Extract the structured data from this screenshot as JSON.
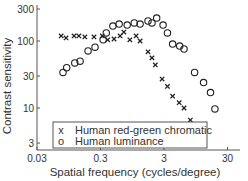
{
  "chart_data": {
    "type": "scatter",
    "title": "",
    "xlabel": "Spatial frequency (cycles/degree)",
    "ylabel": "Contrast sensitivity",
    "xscale": "log",
    "yscale": "log",
    "xlim": [
      0.03,
      40
    ],
    "ylim": [
      2,
      300
    ],
    "xticks": [
      0.03,
      0.3,
      3,
      30
    ],
    "xtick_labels": [
      "0.03",
      "0.3",
      "3",
      "30"
    ],
    "yticks": [
      3,
      10,
      30,
      100,
      300
    ],
    "ytick_labels": [
      "3",
      "10",
      "30",
      "100",
      "300"
    ],
    "grid": false,
    "legend_position": "lower center (inside)",
    "series": [
      {
        "name": "Human red-green chromatic",
        "marker": "x",
        "legend_marker": "x",
        "x": [
          0.072,
          0.086,
          0.115,
          0.137,
          0.17,
          0.237,
          0.32,
          0.39,
          0.49,
          0.61,
          0.7,
          0.87,
          1.09,
          1.26,
          1.68,
          1.94,
          2.19,
          2.8,
          3.4,
          4.1,
          5.2,
          6.2,
          7.8
        ],
        "y": [
          119,
          111,
          119,
          119,
          115,
          115,
          119,
          104,
          107,
          119,
          136,
          104,
          119,
          100,
          69,
          56,
          44,
          27,
          21,
          15,
          12,
          10,
          6.6
        ]
      },
      {
        "name": "Human luminance",
        "marker": "o",
        "legend_marker": "o",
        "x": [
          0.077,
          0.088,
          0.118,
          0.143,
          0.191,
          0.246,
          0.33,
          0.37,
          0.47,
          0.59,
          0.79,
          1.02,
          1.26,
          1.68,
          1.94,
          2.3,
          2.9,
          3.4,
          4.1,
          5.3,
          6.2,
          9.1,
          12.6,
          16.2,
          19
        ],
        "y": [
          34,
          40,
          47,
          50,
          71,
          81,
          104,
          132,
          167,
          179,
          173,
          186,
          179,
          199,
          186,
          220,
          173,
          132,
          90,
          84,
          76,
          34,
          24,
          17,
          9.7
        ]
      }
    ]
  }
}
